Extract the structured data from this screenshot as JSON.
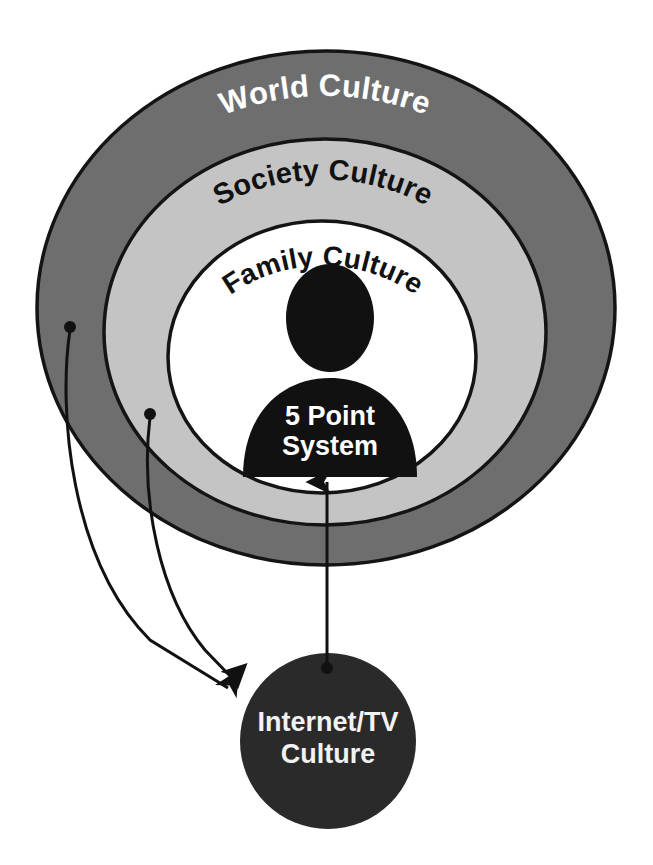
{
  "diagram": {
    "type": "concentric-circles-with-arrows",
    "background_color": "#ffffff",
    "rings": [
      {
        "id": "world",
        "label": "World Culture",
        "fill_color": "#6e6e6e",
        "text_color": "#ffffff",
        "stroke_color": "#141414",
        "level": 1
      },
      {
        "id": "society",
        "label": "Society Culture",
        "fill_color": "#c4c4c4",
        "text_color": "#111111",
        "stroke_color": "#141414",
        "level": 2
      },
      {
        "id": "family",
        "label": "Family Culture",
        "fill_color": "#ffffff",
        "text_color": "#111111",
        "stroke_color": "#141414",
        "level": 3
      }
    ],
    "center_figure": {
      "id": "person",
      "icon": "person-silhouette-icon",
      "fill_color": "#111111",
      "text_color": "#ffffff",
      "line1": "5 Point",
      "line2": "System"
    },
    "external_node": {
      "id": "internet-tv",
      "fill_color": "#2a2a2a",
      "text_color": "#f2f2f2",
      "line1": "Internet/TV",
      "line2": "Culture"
    },
    "arrows": [
      {
        "id": "arrow-world-to-internet",
        "from": "world",
        "to": "internet-tv",
        "style": "curved",
        "color": "#111111"
      },
      {
        "id": "arrow-society-to-internet",
        "from": "society",
        "to": "internet-tv",
        "style": "curved",
        "color": "#111111"
      },
      {
        "id": "arrow-internet-to-person",
        "from": "internet-tv",
        "to": "person",
        "style": "straight-vertical",
        "color": "#111111"
      }
    ]
  }
}
